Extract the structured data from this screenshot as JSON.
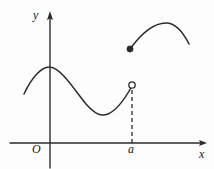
{
  "figure": {
    "kind": "hand-drawn-cartesian-graph",
    "background_color": "#fdfdfd",
    "ink_color": "#2a2a2a",
    "labels": {
      "y_axis": "y",
      "x_axis": "x",
      "origin": "O",
      "x_mark": "a"
    },
    "axes": {
      "x_axis": {
        "from": [
          10,
          143
        ],
        "to": [
          207,
          143
        ],
        "arrow": "right"
      },
      "y_axis": {
        "from": [
          50,
          168
        ],
        "to": [
          50,
          13
        ],
        "arrow": "up"
      },
      "origin_point": [
        50,
        143
      ]
    },
    "markers": {
      "open_circle": {
        "center": [
          132,
          85
        ],
        "radius": 3.2,
        "filled": false
      },
      "filled_dot": {
        "center": [
          130,
          49
        ],
        "radius": 3.0,
        "filled": true
      },
      "dashed_drop_line": {
        "from": [
          132,
          89
        ],
        "to": [
          132,
          143
        ],
        "dash": "4 3"
      }
    }
  },
  "chart_data": {
    "type": "line",
    "title": "",
    "xlabel": "x",
    "ylabel": "y",
    "grid": false,
    "legend": null,
    "annotations": [
      {
        "text": "O",
        "at": [
          50,
          143
        ],
        "role": "origin-label"
      },
      {
        "text": "a",
        "at": [
          132,
          143
        ],
        "role": "x-tick-label"
      },
      {
        "text": "y",
        "at": [
          50,
          13
        ],
        "role": "y-axis-label"
      },
      {
        "text": "x",
        "at": [
          207,
          143
        ],
        "role": "x-axis-label"
      }
    ],
    "series": [
      {
        "name": "left-branch",
        "style": "solid",
        "endpoint_left": "open-ended",
        "endpoint_right": "open-circle-at-x-equals-a",
        "path": "M 24 94 C 32 77, 42 66, 50 67 C 61 68, 73 88, 86 104 C 95 114, 101 117, 108 114 C 117 110, 126 97, 132 86"
      },
      {
        "name": "right-branch",
        "style": "solid",
        "endpoint_left": "filled-dot-above-x-equals-a",
        "endpoint_right": "open-ended",
        "path": "M 130 49 C 141 34, 154 23, 166 23 C 176 23, 183 32, 189 44"
      }
    ]
  }
}
